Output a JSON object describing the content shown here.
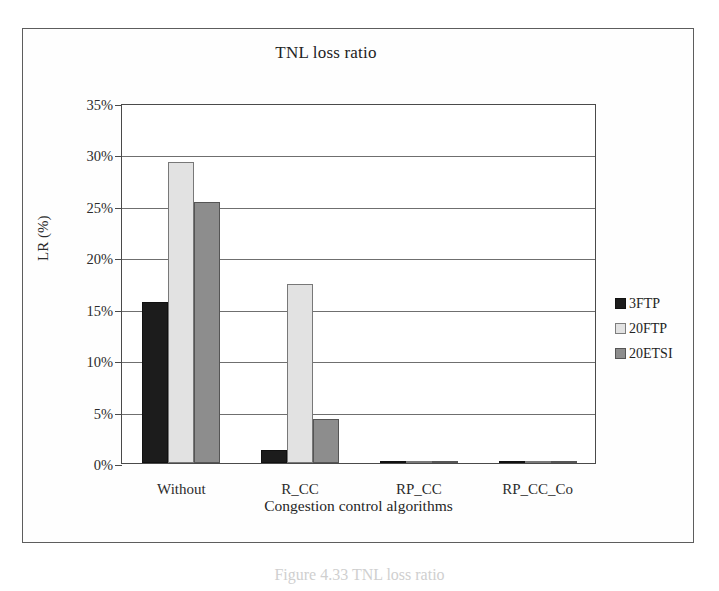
{
  "figure": {
    "caption": "Figure 4.33  TNL loss ratio"
  },
  "chart_data": {
    "type": "bar",
    "title": "TNL loss ratio",
    "xlabel": "Congestion control algorithms",
    "ylabel": "LR (%)",
    "categories": [
      "Without",
      "R_CC",
      "RP_CC",
      "RP_CC_Co"
    ],
    "series": [
      {
        "name": "3FTP",
        "color": "#1c1c1c",
        "values": [
          15.7,
          1.3,
          0.0,
          0.0
        ]
      },
      {
        "name": "20FTP",
        "color": "#e2e2e2",
        "values": [
          29.3,
          17.4,
          0.1,
          0.05
        ]
      },
      {
        "name": "20ETSI",
        "color": "#8d8d8d",
        "values": [
          25.4,
          4.3,
          0.2,
          0.15
        ]
      }
    ],
    "ylim": [
      0,
      35
    ],
    "yticks": [
      0,
      5,
      10,
      15,
      20,
      25,
      30,
      35
    ],
    "ytick_labels": [
      "0%",
      "5%",
      "10%",
      "15%",
      "20%",
      "25%",
      "30%",
      "35%"
    ],
    "grid": true,
    "legend_position": "right"
  }
}
